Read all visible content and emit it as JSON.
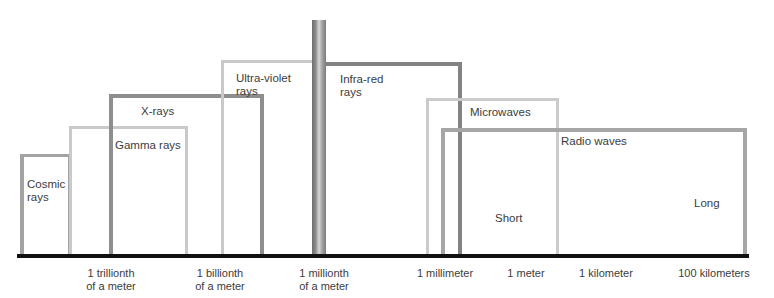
{
  "diagram": {
    "colors": {
      "light": "#c9c9c9",
      "medium": "#a3a3a3",
      "dark": "#878787",
      "baseline": "#111111"
    },
    "bands": [
      {
        "id": "cosmic",
        "label_line1": "Cosmic",
        "label_line2": "rays"
      },
      {
        "id": "gamma",
        "label_line1": "Gamma rays"
      },
      {
        "id": "xray",
        "label_line1": "X-rays"
      },
      {
        "id": "uv",
        "label_line1": "Ultra-violet",
        "label_line2": "rays"
      },
      {
        "id": "visible",
        "label_line1": ""
      },
      {
        "id": "ir",
        "label_line1": "Infra-red",
        "label_line2": "rays"
      },
      {
        "id": "microwave",
        "label_line1": "Microwaves"
      },
      {
        "id": "radio",
        "label_line1": "Radio waves",
        "sub_short": "Short",
        "sub_long": "Long"
      }
    ],
    "axis_ticks": [
      {
        "line1": "1 trillionth",
        "line2": "of a meter"
      },
      {
        "line1": "1 billionth",
        "line2": "of a meter"
      },
      {
        "line1": "1 millionth",
        "line2": "of a meter"
      },
      {
        "line1": "1 millimeter"
      },
      {
        "line1": "1 meter"
      },
      {
        "line1": "1 kilometer"
      },
      {
        "line1": "100 kilometers"
      }
    ]
  }
}
